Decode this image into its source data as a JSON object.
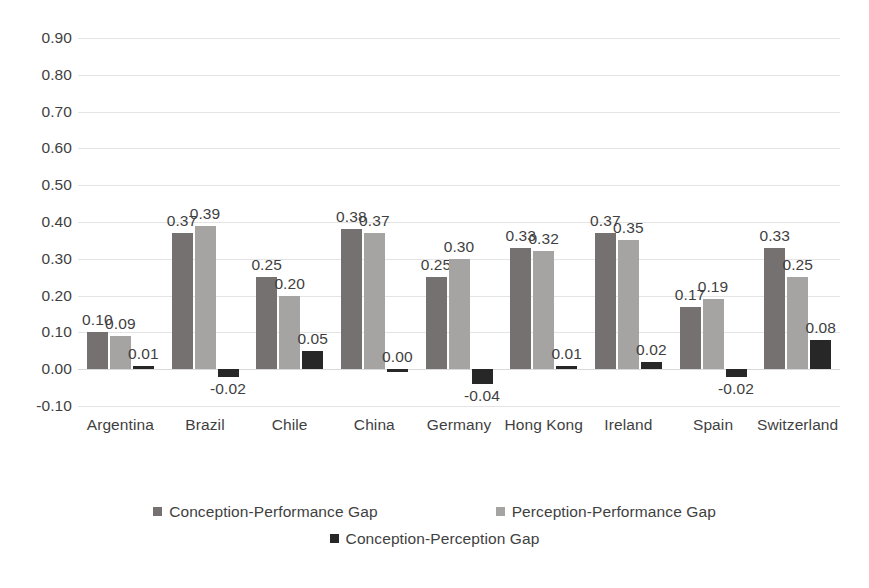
{
  "chart_data": {
    "type": "bar",
    "title": "",
    "subtitle": "",
    "xlabel": "",
    "ylabel": "",
    "ylim": [
      -0.1,
      0.9
    ],
    "ytick_step": 0.1,
    "yticks": [
      "0.90",
      "0.80",
      "0.70",
      "0.60",
      "0.50",
      "0.40",
      "0.30",
      "0.20",
      "0.10",
      "0.00",
      "-0.10"
    ],
    "grid": true,
    "legend_position": "bottom",
    "data_labels": true,
    "categories": [
      "Argentina",
      "Brazil",
      "Chile",
      "China",
      "Germany",
      "Hong Kong",
      "Ireland",
      "Spain",
      "Switzerland"
    ],
    "series": [
      {
        "name": "Conception-Performance Gap",
        "color": "#767171",
        "values": [
          0.1,
          0.37,
          0.25,
          0.38,
          0.25,
          0.33,
          0.37,
          0.17,
          0.33
        ],
        "labels": [
          "0.10",
          "0.37",
          "0.25",
          "0.38",
          "0.25",
          "0.33",
          "0.37",
          "0.17",
          "0.33"
        ]
      },
      {
        "name": "Perception-Performance Gap",
        "color": "#a6a3a3",
        "values": [
          0.09,
          0.39,
          0.2,
          0.37,
          0.3,
          0.32,
          0.35,
          0.19,
          0.25
        ],
        "labels": [
          "0.09",
          "0.39",
          "0.20",
          "0.37",
          "0.30",
          "0.32",
          "0.35",
          "0.19",
          "0.25"
        ]
      },
      {
        "name": "Conception-Perception Gap",
        "color": "#272727",
        "values": [
          0.01,
          -0.02,
          0.05,
          0.0,
          -0.04,
          0.01,
          0.02,
          -0.02,
          0.08
        ],
        "labels": [
          "0.01",
          "-0.02",
          "0.05",
          "0.00",
          "-0.04",
          "0.01",
          "0.02",
          "-0.02",
          "0.08"
        ]
      }
    ]
  },
  "legend": {
    "items": [
      {
        "label": "Conception-Performance Gap"
      },
      {
        "label": "Perception-Performance Gap"
      },
      {
        "label": "Conception-Perception Gap"
      }
    ]
  },
  "colors": {
    "series_1": "#767171",
    "series_2": "#a6a3a3",
    "series_3": "#272727",
    "gridline": "#e4e4e4",
    "text": "#3f3f3f",
    "background": "#ffffff"
  }
}
